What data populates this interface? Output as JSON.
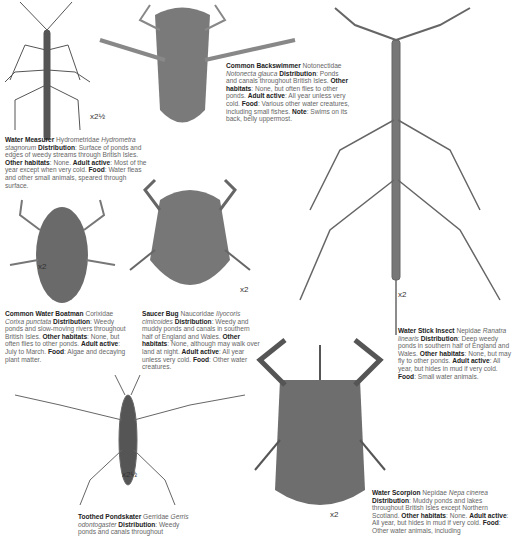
{
  "species": [
    {
      "id": "water-measurer",
      "name": "Water Measurer",
      "family": "Hydrometridae",
      "latin": "Hydrometra stagnorum",
      "distribution": "Surface of ponds and edges of weedy streams through British Isles.",
      "other_habitats": "None.",
      "adult_active": "Most of the year except when very cold.",
      "food": "Water fleas and other small animals, speared through surface.",
      "scale": "x2½"
    },
    {
      "id": "common-backswimmer",
      "name": "Common Backswimmer",
      "family": "Notonectidae",
      "latin": "Notonecta glauca",
      "distribution": "Ponds and canals throughout British Isles.",
      "other_habitats": "None, but often flies to other ponds.",
      "adult_active": "All year unless very cold.",
      "food": "Various other water creatures, including small fishes.",
      "note": "Swims on its back, belly uppermost."
    },
    {
      "id": "common-water-boatman",
      "name": "Common Water Boatman",
      "family": "Corixidae",
      "latin": "Corixa punctata",
      "distribution": "Weedy ponds and slow-moving rivers throughout British Isles.",
      "other_habitats": "None, but often flies to other ponds.",
      "adult_active": "July to March.",
      "food": "Algae and decaying plant matter.",
      "scale": "x2"
    },
    {
      "id": "saucer-bug",
      "name": "Saucer Bug",
      "family": "Naucoridae",
      "latin": "Ilyocoris cimicoides",
      "distribution": "Weedy and muddy ponds and canals in southern half of England and Wales.",
      "other_habitats": "None, although may walk over land at night.",
      "adult_active": "All year unless very cold.",
      "food": "Other water creatures.",
      "scale": "x2"
    },
    {
      "id": "water-stick-insect",
      "name": "Water Stick Insect",
      "family": "Nepidae",
      "latin": "Ranatra linearis",
      "distribution": "Deep weedy ponds in southern half of England and Wales.",
      "other_habitats": "None, but may fly to other ponds.",
      "adult_active": "All year, but hides in mud if very cold.",
      "food": "Small water animals.",
      "scale": "x2"
    },
    {
      "id": "toothed-pondskater",
      "name": "Toothed Pondskater",
      "family": "Gerridae",
      "latin": "Gerris odontogaster",
      "distribution": "Weedy ponds and canals throughout",
      "scale": "x2½"
    },
    {
      "id": "water-scorpion",
      "name": "Water Scorpion",
      "family": "Nepidae",
      "latin": "Nepa cinerea",
      "distribution": "Muddy ponds and lakes throughout British Isles except Northern Scotland.",
      "other_habitats": "None.",
      "adult_active": "All year, but hides in mud if very cold.",
      "food": "Other water animals, including",
      "scale": "x2"
    }
  ],
  "labels": {
    "distribution": "Distribution",
    "other_habitats": "Other habitats",
    "adult_active": "Adult active",
    "food": "Food",
    "note": "Note"
  }
}
